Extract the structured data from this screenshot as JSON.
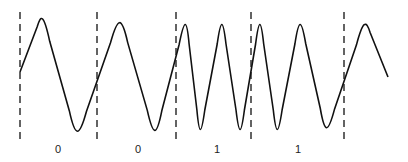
{
  "diagram": {
    "type": "fsk-waveform",
    "bits": [
      "0",
      "0",
      "1",
      "1"
    ],
    "cycles_per_bit": {
      "0": 1,
      "1": 2
    },
    "colors": {
      "line": "#111111",
      "boundary": "#222222",
      "background": "#ffffff"
    }
  }
}
